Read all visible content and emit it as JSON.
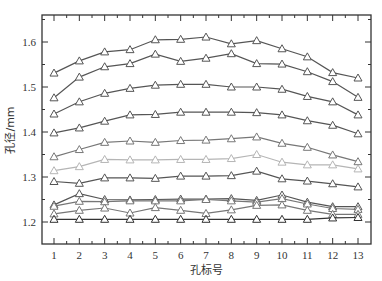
{
  "chart_data": {
    "type": "line",
    "title": "",
    "xlabel": "孔标号",
    "ylabel": "孔径/mm",
    "x": [
      1,
      2,
      3,
      4,
      5,
      6,
      7,
      8,
      9,
      10,
      11,
      12,
      13
    ],
    "xticks": [
      "1",
      "2",
      "3",
      "4",
      "5",
      "6",
      "7",
      "8",
      "9",
      "10",
      "11",
      "12",
      "13"
    ],
    "yticks": [
      "1.2",
      "1.3",
      "1.4",
      "1.5",
      "1.6"
    ],
    "ylim": [
      1.15,
      1.67
    ],
    "xlim": [
      0.5,
      13.5
    ],
    "grid": false,
    "legend": null,
    "marker": "open-triangle",
    "series": [
      {
        "name": "series-1",
        "color": "#555555",
        "values": [
          1.531,
          1.558,
          1.578,
          1.583,
          1.605,
          1.606,
          1.611,
          1.596,
          1.603,
          1.585,
          1.567,
          1.532,
          1.52
        ]
      },
      {
        "name": "series-2",
        "color": "#555555",
        "values": [
          1.476,
          1.522,
          1.545,
          1.552,
          1.573,
          1.557,
          1.564,
          1.574,
          1.552,
          1.551,
          1.534,
          1.512,
          1.477
        ]
      },
      {
        "name": "series-3",
        "color": "#555555",
        "values": [
          1.44,
          1.467,
          1.486,
          1.497,
          1.504,
          1.506,
          1.506,
          1.5,
          1.5,
          1.495,
          1.479,
          1.467,
          1.438
        ]
      },
      {
        "name": "series-4",
        "color": "#555555",
        "values": [
          1.398,
          1.409,
          1.424,
          1.438,
          1.439,
          1.444,
          1.444,
          1.444,
          1.443,
          1.438,
          1.425,
          1.415,
          1.396
        ]
      },
      {
        "name": "series-5",
        "color": "#777777",
        "values": [
          1.345,
          1.361,
          1.377,
          1.38,
          1.377,
          1.381,
          1.382,
          1.385,
          1.389,
          1.375,
          1.366,
          1.349,
          1.334
        ]
      },
      {
        "name": "series-6",
        "color": "#b5b5b5",
        "values": [
          1.314,
          1.323,
          1.339,
          1.338,
          1.338,
          1.339,
          1.339,
          1.341,
          1.35,
          1.333,
          1.327,
          1.327,
          1.318
        ]
      },
      {
        "name": "series-7",
        "color": "#555555",
        "values": [
          1.29,
          1.286,
          1.298,
          1.298,
          1.297,
          1.302,
          1.302,
          1.303,
          1.313,
          1.296,
          1.291,
          1.285,
          1.278
        ]
      },
      {
        "name": "series-8",
        "color": "#555555",
        "values": [
          1.238,
          1.263,
          1.25,
          1.249,
          1.25,
          1.251,
          1.251,
          1.252,
          1.248,
          1.26,
          1.244,
          1.234,
          1.234
        ]
      },
      {
        "name": "series-9",
        "color": "#777777",
        "values": [
          1.235,
          1.246,
          1.245,
          1.247,
          1.247,
          1.247,
          1.25,
          1.247,
          1.244,
          1.252,
          1.24,
          1.23,
          1.228
        ]
      },
      {
        "name": "series-10",
        "color": "#777777",
        "values": [
          1.218,
          1.226,
          1.231,
          1.22,
          1.232,
          1.226,
          1.219,
          1.227,
          1.237,
          1.238,
          1.226,
          1.217,
          1.217
        ]
      },
      {
        "name": "series-11",
        "color": "#333333",
        "values": [
          1.206,
          1.206,
          1.206,
          1.206,
          1.206,
          1.206,
          1.206,
          1.206,
          1.206,
          1.206,
          1.206,
          1.209,
          1.21
        ]
      }
    ]
  },
  "axes": {
    "xlabel": "孔标号",
    "ylabel": "孔径/mm"
  }
}
